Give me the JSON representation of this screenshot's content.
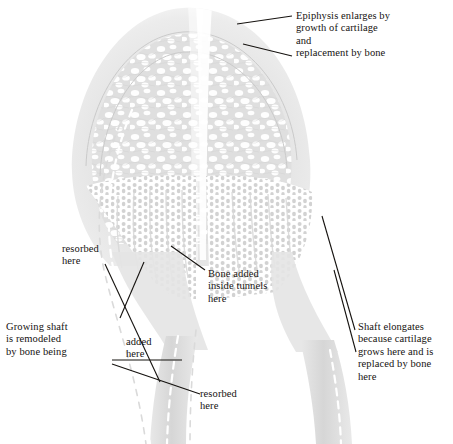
{
  "figure": {
    "background_color": "#ffffff",
    "bone_tone": "#e3e3e3",
    "bone_tone_dark": "#cfcfcf",
    "line_color": "#15120f",
    "ink_color": "#15120f"
  },
  "annotations": {
    "epiphysis": "Epiphysis enlarges by\ngrowth of cartilage\nand\nreplacement by bone",
    "resorbed_top": "resorbed\nhere",
    "bone_added": "Bone added\ninside tunnels\nhere",
    "growing_shaft": "Growing shaft\nis remodeled\nby bone being",
    "added": "added\nhere",
    "resorbed_bottom": "resorbed\nhere",
    "shaft_elongates": "Shaft elongates\nbecause cartilage\ngrows here and is\nreplaced by bone\nhere"
  },
  "structures": {
    "epiphysis_label": "epiphysis-dome",
    "growth_plate_label": "growth-plate",
    "metaphysis_label": "metaphysis-tunnels",
    "shaft_label": "diaphysis-shaft",
    "dashed_outline_label": "former-bone-outline"
  }
}
